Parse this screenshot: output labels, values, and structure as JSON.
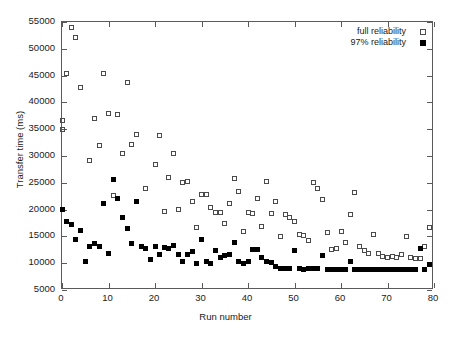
{
  "chart_data": {
    "type": "scatter",
    "title": "",
    "xlabel": "Run number",
    "ylabel": "Transfer time (ms)",
    "xlim": [
      0,
      80
    ],
    "ylim": [
      5000,
      55000
    ],
    "xticks": [
      0,
      10,
      20,
      30,
      40,
      50,
      60,
      70,
      80
    ],
    "yticks": [
      5000,
      10000,
      15000,
      20000,
      25000,
      30000,
      35000,
      40000,
      45000,
      50000,
      55000
    ],
    "grid": false,
    "legend_position": "top-right inside",
    "series": [
      {
        "name": "full reliability",
        "marker": "open-square",
        "color": "#4a4a4a",
        "points": [
          [
            0,
            36700
          ],
          [
            0,
            35000
          ],
          [
            1,
            45300
          ],
          [
            2,
            53900
          ],
          [
            3,
            52100
          ],
          [
            4,
            42700
          ],
          [
            6,
            29200
          ],
          [
            7,
            37000
          ],
          [
            8,
            31900
          ],
          [
            9,
            45300
          ],
          [
            10,
            37900
          ],
          [
            11,
            22700
          ],
          [
            12,
            37800
          ],
          [
            13,
            30400
          ],
          [
            14,
            43800
          ],
          [
            15,
            32200
          ],
          [
            16,
            34000
          ],
          [
            18,
            24000
          ],
          [
            20,
            28500
          ],
          [
            21,
            33800
          ],
          [
            22,
            19600
          ],
          [
            23,
            26000
          ],
          [
            24,
            30400
          ],
          [
            25,
            20100
          ],
          [
            26,
            25000
          ],
          [
            27,
            25200
          ],
          [
            28,
            21500
          ],
          [
            29,
            16700
          ],
          [
            30,
            22900
          ],
          [
            31,
            22800
          ],
          [
            32,
            20300
          ],
          [
            33,
            19500
          ],
          [
            34,
            19500
          ],
          [
            35,
            17500
          ],
          [
            36,
            21100
          ],
          [
            37,
            25800
          ],
          [
            38,
            23300
          ],
          [
            39,
            16000
          ],
          [
            40,
            19400
          ],
          [
            41,
            19300
          ],
          [
            42,
            22000
          ],
          [
            43,
            16900
          ],
          [
            44,
            25200
          ],
          [
            45,
            19200
          ],
          [
            46,
            21600
          ],
          [
            47,
            14900
          ],
          [
            48,
            19000
          ],
          [
            49,
            18600
          ],
          [
            50,
            17700
          ],
          [
            51,
            15300
          ],
          [
            52,
            15100
          ],
          [
            53,
            14300
          ],
          [
            54,
            25000
          ],
          [
            55,
            23900
          ],
          [
            56,
            21900
          ],
          [
            57,
            15800
          ],
          [
            58,
            12600
          ],
          [
            59,
            12800
          ],
          [
            60,
            15900
          ],
          [
            61,
            13900
          ],
          [
            62,
            19100
          ],
          [
            63,
            23100
          ],
          [
            64,
            13200
          ],
          [
            65,
            12300
          ],
          [
            66,
            11800
          ],
          [
            67,
            15300
          ],
          [
            68,
            11900
          ],
          [
            69,
            11300
          ],
          [
            70,
            11000
          ],
          [
            71,
            11200
          ],
          [
            72,
            11100
          ],
          [
            73,
            11600
          ],
          [
            74,
            14900
          ],
          [
            75,
            11000
          ],
          [
            76,
            10900
          ],
          [
            77,
            10800
          ],
          [
            78,
            13100
          ],
          [
            79,
            16700
          ]
        ]
      },
      {
        "name": "97% reliability",
        "marker": "filled-square",
        "color": "#000000",
        "points": [
          [
            0,
            20000
          ],
          [
            1,
            17700
          ],
          [
            2,
            17300
          ],
          [
            3,
            14500
          ],
          [
            4,
            16100
          ],
          [
            5,
            10300
          ],
          [
            6,
            13200
          ],
          [
            7,
            13600
          ],
          [
            8,
            13200
          ],
          [
            9,
            21100
          ],
          [
            10,
            11900
          ],
          [
            11,
            25700
          ],
          [
            12,
            22000
          ],
          [
            13,
            18500
          ],
          [
            14,
            16400
          ],
          [
            15,
            13700
          ],
          [
            16,
            21500
          ],
          [
            17,
            13200
          ],
          [
            18,
            12800
          ],
          [
            19,
            10600
          ],
          [
            20,
            13100
          ],
          [
            21,
            11600
          ],
          [
            22,
            12900
          ],
          [
            23,
            12800
          ],
          [
            24,
            13300
          ],
          [
            25,
            11700
          ],
          [
            26,
            10300
          ],
          [
            27,
            11700
          ],
          [
            28,
            12200
          ],
          [
            29,
            10000
          ],
          [
            30,
            14500
          ],
          [
            31,
            10400
          ],
          [
            32,
            9900
          ],
          [
            33,
            12400
          ],
          [
            34,
            11000
          ],
          [
            35,
            11400
          ],
          [
            36,
            11600
          ],
          [
            37,
            13800
          ],
          [
            38,
            10400
          ],
          [
            39,
            10000
          ],
          [
            40,
            10300
          ],
          [
            41,
            12500
          ],
          [
            42,
            12500
          ],
          [
            43,
            11000
          ],
          [
            44,
            10300
          ],
          [
            45,
            10100
          ],
          [
            46,
            9300
          ],
          [
            47,
            9000
          ],
          [
            48,
            9100
          ],
          [
            49,
            9000
          ],
          [
            50,
            12300
          ],
          [
            51,
            9000
          ],
          [
            52,
            8900
          ],
          [
            53,
            9000
          ],
          [
            54,
            9000
          ],
          [
            55,
            9100
          ],
          [
            56,
            11500
          ],
          [
            57,
            8900
          ],
          [
            58,
            8800
          ],
          [
            59,
            8800
          ],
          [
            60,
            8800
          ],
          [
            61,
            8800
          ],
          [
            62,
            10400
          ],
          [
            63,
            8900
          ],
          [
            64,
            8900
          ],
          [
            65,
            8800
          ],
          [
            66,
            8800
          ],
          [
            67,
            8800
          ],
          [
            68,
            8800
          ],
          [
            69,
            8800
          ],
          [
            70,
            8800
          ],
          [
            71,
            8800
          ],
          [
            72,
            8800
          ],
          [
            73,
            8800
          ],
          [
            74,
            8800
          ],
          [
            75,
            8800
          ],
          [
            76,
            8800
          ],
          [
            77,
            12700
          ],
          [
            78,
            8800
          ],
          [
            79,
            9800
          ]
        ]
      }
    ]
  },
  "legend": {
    "entries": [
      {
        "label": "full reliability",
        "marker": "open-square"
      },
      {
        "label": "97% reliability",
        "marker": "filled-square"
      }
    ]
  }
}
